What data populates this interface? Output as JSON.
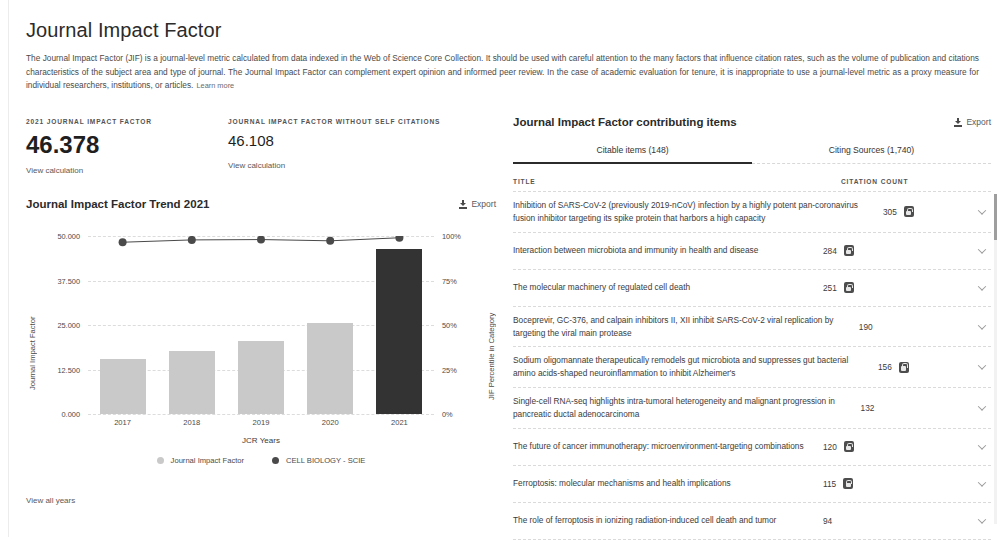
{
  "header": {
    "title": "Journal Impact Factor",
    "intro": "The Journal Impact Factor (JIF) is a journal-level metric calculated from data indexed in the Web of Science Core Collection. It should be used with careful attention to the many factors that influence citation rates, such as the volume of publication and citations characteristics of the subject area and type of journal. The Journal Impact Factor can complement expert opinion and informed peer review. In the case of academic evaluation for tenure, it is inappropriate to use a journal-level metric as a proxy measure for individual researchers, institutions, or articles.",
    "learn_more": "Learn more"
  },
  "metrics": [
    {
      "label": "2021 JOURNAL IMPACT FACTOR",
      "value": "46.378",
      "link": "View calculation"
    },
    {
      "label": "JOURNAL IMPACT FACTOR WITHOUT SELF CITATIONS",
      "value": "46.108",
      "link": "View calculation"
    }
  ],
  "chart_panel": {
    "title": "Journal Impact Factor Trend 2021",
    "export_label": "Export",
    "export_icon": "download-icon",
    "view_all_label": "View all years"
  },
  "chart_data": {
    "type": "bar",
    "title": "Journal Impact Factor Trend 2021",
    "categories": [
      "2017",
      "2018",
      "2019",
      "2020",
      "2021"
    ],
    "xlabel": "JCR Years",
    "ylabel": "Journal Impact Factor",
    "y2label": "JIF Percentile in Category",
    "ylim": [
      0,
      50
    ],
    "y2lim": [
      0,
      100
    ],
    "yticks": [
      "0.000",
      "12.500",
      "25.000",
      "37.500",
      "50.000"
    ],
    "ytick_values": [
      0,
      12.5,
      25,
      37.5,
      50
    ],
    "y2ticks": [
      "0%",
      "25%",
      "50%",
      "75%",
      "100%"
    ],
    "y2tick_values": [
      0,
      25,
      50,
      75,
      100
    ],
    "grid": true,
    "legend_position": "bottom",
    "series": [
      {
        "name": "Journal Impact Factor",
        "kind": "bar",
        "color": "#c9c9c9",
        "highlight_color": "#333333",
        "highlight_index": 4,
        "values": [
          15.5,
          17.8,
          20.5,
          25.5,
          46.378
        ]
      },
      {
        "name": "CELL BIOLOGY - SCIE",
        "kind": "line",
        "color": "#4a4a4a",
        "axis": "right",
        "values": [
          96.5,
          97.8,
          98.0,
          97.3,
          99.0
        ]
      }
    ]
  },
  "items_panel": {
    "title": "Journal Impact Factor contributing items",
    "export_label": "Export",
    "export_icon": "download-icon",
    "tabs": [
      {
        "label": "Citable items (148)",
        "active": true
      },
      {
        "label": "Citing Sources (1,740)",
        "active": false
      }
    ],
    "columns": {
      "title": "TITLE",
      "citation_count": "CITATION COUNT"
    },
    "rows": [
      {
        "title": "Inhibition of SARS-CoV-2 (previously 2019-nCoV) infection by a highly potent pan-coronavirus fusion inhibitor targeting its spike protein that harbors a high capacity",
        "count": "305",
        "open_access": true
      },
      {
        "title": "Interaction between microbiota and immunity in health and disease",
        "count": "284",
        "open_access": true
      },
      {
        "title": "The molecular machinery of regulated cell death",
        "count": "251",
        "open_access": true
      },
      {
        "title": "Boceprevir, GC-376, and calpain inhibitors II, XII inhibit SARS-CoV-2 viral replication by targeting the viral main protease",
        "count": "190",
        "open_access": false
      },
      {
        "title": "Sodium oligomannate therapeutically remodels gut microbiota and suppresses gut bacterial amino acids-shaped neuroinflammation to inhibit Alzheimer's",
        "count": "156",
        "open_access": true
      },
      {
        "title": "Single-cell RNA-seq highlights intra-tumoral heterogeneity and malignant progression in pancreatic ductal adenocarcinoma",
        "count": "132",
        "open_access": false
      },
      {
        "title": "The future of cancer immunotherapy: microenvironment-targeting combinations",
        "count": "120",
        "open_access": true
      },
      {
        "title": "Ferroptosis: molecular mechanisms and health implications",
        "count": "115",
        "open_access": true
      },
      {
        "title": "The role of ferroptosis in ionizing radiation-induced cell death and tumor",
        "count": "94",
        "open_access": false
      }
    ]
  }
}
